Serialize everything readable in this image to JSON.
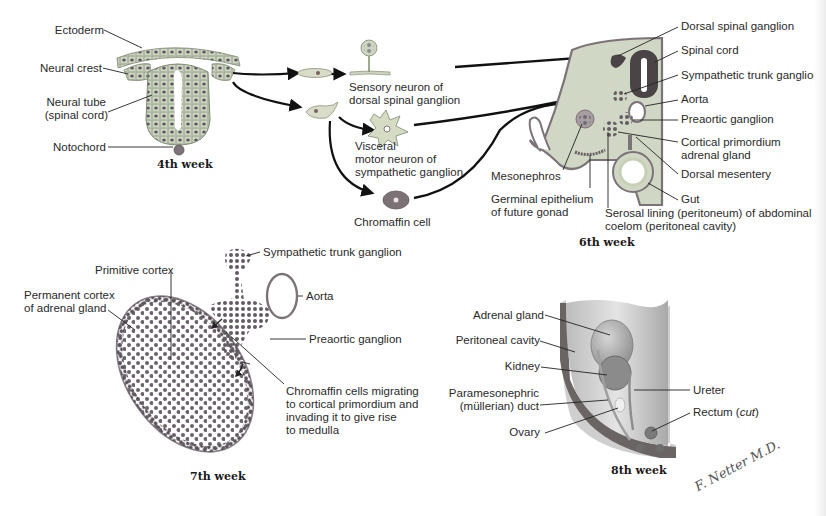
{
  "figure": {
    "panels": [
      {
        "id": "week4",
        "caption": "4th week",
        "labels": {
          "ectoderm": "Ectoderm",
          "neural_crest": "Neural crest",
          "neural_tube_1": "Neural tube",
          "neural_tube_2": "(spinal cord)",
          "notochord": "Notochord"
        }
      },
      {
        "id": "derivatives",
        "labels": {
          "sensory_1": "Sensory neuron of",
          "sensory_2": "dorsal spinal ganglion",
          "visceral_1": "Visceral",
          "visceral_2": "motor neuron of",
          "visceral_3": "sympathetic ganglion",
          "chromaffin": "Chromaffin cell"
        }
      },
      {
        "id": "week6",
        "caption": "6th week",
        "labels": {
          "dorsal_spinal_ganglion": "Dorsal spinal ganglion",
          "spinal_cord": "Spinal cord",
          "sympathetic_trunk_ganglion": "Sympathetic trunk ganglion",
          "aorta": "Aorta",
          "preaortic_ganglion": "Preaortic ganglion",
          "cortical_primordium_1": "Cortical primordium",
          "cortical_primordium_2": "adrenal gland",
          "dorsal_mesentery": "Dorsal mesentery",
          "gut": "Gut",
          "mesonephros": "Mesonephros",
          "germinal_1": "Germinal epithelium",
          "germinal_2": "of future gonad",
          "serosal_1": "Serosal lining (peritoneum) of abdominal",
          "serosal_2": "coelom (peritoneal cavity)"
        }
      },
      {
        "id": "week7",
        "caption": "7th week",
        "labels": {
          "sympathetic_trunk_ganglion": "Sympathetic trunk ganglion",
          "primitive_cortex": "Primitive cortex",
          "permanent_cortex_1": "Permanent cortex",
          "permanent_cortex_2": "of adrenal gland",
          "aorta": "Aorta",
          "preaortic_ganglion": "Preaortic ganglion",
          "chromaffin_1": "Chromaffin cells migrating",
          "chromaffin_2": "to cortical primordium and",
          "chromaffin_3": "invading it to give rise",
          "chromaffin_4": "to medulla"
        }
      },
      {
        "id": "week8",
        "caption": "8th week",
        "labels": {
          "adrenal_gland": "Adrenal gland",
          "peritoneal_cavity": "Peritoneal cavity",
          "kidney": "Kidney",
          "paramesonephric_1": "Paramesonephric",
          "paramesonephric_2": "(müllerian) duct",
          "ovary": "Ovary",
          "ureter": "Ureter",
          "rectum": "Rectum",
          "rectum_note": "cut"
        }
      }
    ],
    "signature": "F. Netter M.D.",
    "colors": {
      "tissue_fill": "#cfd8c4",
      "tissue_stroke": "#7a8a70",
      "cell_dot": "#6a5e66",
      "neural_dark": "#4a4446",
      "ganglion_dot": "#5e5860",
      "aorta_stroke": "#7a7278",
      "gut_ring": "#c9d4b8",
      "body_wall": "#6b6666",
      "arrow": "#111111",
      "text": "#2a2a2a"
    }
  }
}
